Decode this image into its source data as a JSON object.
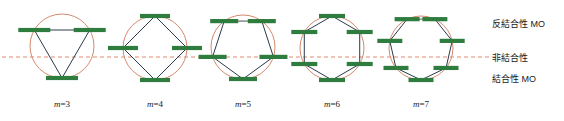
{
  "figure": {
    "type": "frost-circle-mo-diagram",
    "background": "#ffffff",
    "colors": {
      "circle": "#d4896b",
      "dashed_nonbonding_line": "#e08a6e",
      "polygon_edge": "#2b3a4a",
      "energy_level_bar": "#2f7d3e",
      "inactive_edge": "#9a9a9a",
      "text": "#1a1a1a"
    },
    "nonbonding_line": {
      "name": "nonbonding-axis",
      "y": 57,
      "x_start": 2,
      "x_end": 500,
      "style": "dashed"
    }
  },
  "diagrams": [
    {
      "id": "m3",
      "label_m": "m",
      "label_eq": "=",
      "label_n": "3",
      "label": "m=3",
      "center_x": 62,
      "center_y": 46,
      "radius": 32,
      "sides": 3,
      "rotation_deg": 180,
      "label_x": 62,
      "label_y": 99,
      "bar_width": 32,
      "top_edge_gray": true
    },
    {
      "id": "m4",
      "label_m": "m",
      "label_eq": "=",
      "label_n": "4",
      "label": "m=4",
      "center_x": 155,
      "center_y": 48,
      "radius": 32,
      "sides": 4,
      "rotation_deg": 180,
      "label_x": 155,
      "label_y": 99,
      "bar_width": 30,
      "top_edge_gray": false
    },
    {
      "id": "m5",
      "label_m": "m",
      "label_eq": "=",
      "label_n": "5",
      "label": "m=5",
      "center_x": 243,
      "center_y": 47,
      "radius": 32,
      "sides": 5,
      "rotation_deg": 180,
      "label_x": 243,
      "label_y": 99,
      "bar_width": 28,
      "top_edge_gray": true
    },
    {
      "id": "m6",
      "label_m": "m",
      "label_eq": "=",
      "label_n": "6",
      "label": "m=6",
      "center_x": 332,
      "center_y": 48,
      "radius": 32,
      "sides": 6,
      "rotation_deg": 180,
      "label_x": 332,
      "label_y": 99,
      "bar_width": 26,
      "top_edge_gray": false
    },
    {
      "id": "m7",
      "label_m": "m",
      "label_eq": "=",
      "label_n": "7",
      "label": "m=7",
      "center_x": 421,
      "center_y": 48,
      "radius": 32,
      "sides": 7,
      "rotation_deg": 180,
      "label_x": 421,
      "label_y": 99,
      "bar_width": 25,
      "top_edge_gray": true
    }
  ],
  "legend": {
    "antibonding": {
      "text": "反結合性 MO",
      "x": 492,
      "y": 17
    },
    "nonbonding": {
      "text": "非結合性",
      "x": 492,
      "y": 51
    },
    "bonding": {
      "text": "結合性 MO",
      "x": 492,
      "y": 72
    }
  },
  "chart_data": {
    "type": "diagram",
    "xlabel": "ring size m",
    "ylabel": "energy",
    "series": [
      {
        "name": "m=3",
        "sides": 3,
        "levels_relative_energy": [
          -2,
          1,
          1
        ],
        "bonding_count": 1,
        "nonbonding_count": 0,
        "antibonding_count": 2
      },
      {
        "name": "m=4",
        "sides": 4,
        "levels_relative_energy": [
          -2,
          0,
          0,
          2
        ],
        "bonding_count": 1,
        "nonbonding_count": 2,
        "antibonding_count": 1
      },
      {
        "name": "m=5",
        "sides": 5,
        "levels_relative_energy": [
          -2,
          -0.618,
          -0.618,
          1.618,
          1.618
        ],
        "bonding_count": 3,
        "nonbonding_count": 0,
        "antibonding_count": 2
      },
      {
        "name": "m=6",
        "sides": 6,
        "levels_relative_energy": [
          -2,
          -1,
          -1,
          1,
          1,
          2
        ],
        "bonding_count": 3,
        "nonbonding_count": 0,
        "antibonding_count": 3
      },
      {
        "name": "m=7",
        "sides": 7,
        "levels_relative_energy": [
          -2,
          -1.247,
          -1.247,
          0.445,
          0.445,
          1.802,
          1.802
        ],
        "bonding_count": 3,
        "nonbonding_count": 0,
        "antibonding_count": 4
      }
    ],
    "legend_entries": [
      "反結合性 MO",
      "非結合性",
      "結合性 MO"
    ],
    "grid": false,
    "legend_position": "right"
  }
}
